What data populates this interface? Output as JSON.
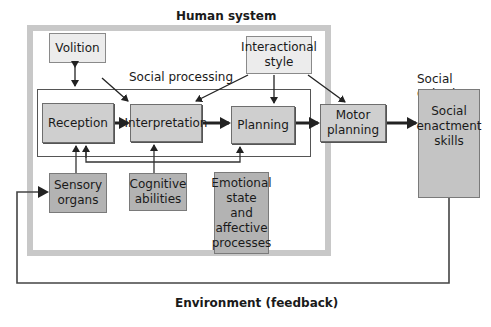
{
  "diagram": {
    "human_system_title": "Human system",
    "social_processing_label": "Social processing",
    "social_output_label": "Social output",
    "environment_label": "Environment (feedback)",
    "nodes": {
      "volition": "Volition",
      "interactional_style": "Interactional\nstyle",
      "reception": "Reception",
      "interpretation": "Interpretation",
      "planning": "Planning",
      "motor_planning": "Motor\nplanning",
      "social_enactment_skills": "Social\nenactment\nskills",
      "sensory_organs": "Sensory\norgans",
      "cognitive_abilities": "Cognitive\nabilities",
      "emotional_state": "Emotional\nstate\nand\naffective\nprocesses"
    },
    "edges": [
      {
        "from": "Volition",
        "to": "Social processing",
        "type": "bidirectional"
      },
      {
        "from": "Volition",
        "to": "Interpretation"
      },
      {
        "from": "Interactional style",
        "to": "Interpretation"
      },
      {
        "from": "Interactional style",
        "to": "Planning"
      },
      {
        "from": "Interactional style",
        "to": "Motor planning"
      },
      {
        "from": "Reception",
        "to": "Interpretation"
      },
      {
        "from": "Interpretation",
        "to": "Planning"
      },
      {
        "from": "Planning",
        "to": "Motor planning"
      },
      {
        "from": "Motor planning",
        "to": "Social enactment skills"
      },
      {
        "from": "Sensory organs",
        "to": "Reception"
      },
      {
        "from": "Cognitive abilities",
        "to": "Reception"
      },
      {
        "from": "Cognitive abilities",
        "to": "Interpretation"
      },
      {
        "from": "Cognitive abilities",
        "to": "Planning"
      },
      {
        "from": "Social enactment skills",
        "to": "Sensory organs",
        "label": "Environment (feedback)"
      }
    ],
    "colors": {
      "outer_frame": "#c8c8c8",
      "light_box": "#ececec",
      "mid_box": "#cfcfcf",
      "dark_box": "#b3b3b3",
      "line": "#222222"
    }
  }
}
